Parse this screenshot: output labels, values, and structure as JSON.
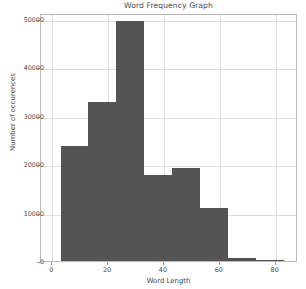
{
  "chart_data": {
    "type": "bar",
    "title": "Word Frequency Graph",
    "xlabel": "Word Length",
    "ylabel": "Number of occurences",
    "grid": true,
    "legend": "none",
    "xlim": [
      -4,
      88
    ],
    "ylim": [
      0,
      51200
    ],
    "xticks": [
      "0",
      "20",
      "40",
      "60",
      "80"
    ],
    "xtick_values": [
      0,
      20,
      40,
      60,
      80
    ],
    "yticks": [
      "0",
      "10000",
      "20000",
      "30000",
      "40000",
      "50000"
    ],
    "ytick_values": [
      0,
      10000,
      20000,
      30000,
      40000,
      50000
    ],
    "bin_edges": [
      3,
      13,
      23,
      33,
      43,
      53,
      63,
      73,
      83
    ],
    "categories": [
      "3-13",
      "13-23",
      "23-33",
      "33-43",
      "43-53",
      "53-63",
      "63-73",
      "73-83"
    ],
    "values": [
      23700,
      32800,
      49500,
      17700,
      19200,
      10900,
      600,
      120
    ],
    "bar_color": "#545454"
  },
  "axes": {
    "title": "Word Frequency Graph",
    "xlabel": "Word Length",
    "ylabel": "Number of occurences"
  }
}
